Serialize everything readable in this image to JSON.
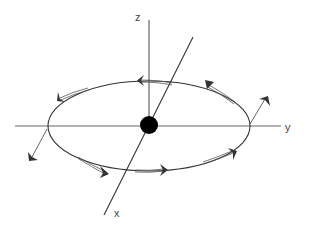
{
  "diagram": {
    "title": "",
    "colors": {
      "line": "#333333",
      "axis": "#666666",
      "arrow": "#333333",
      "dot": "#000000",
      "background": "#ffffff"
    },
    "axes": {
      "z": {
        "label": "z"
      },
      "y": {
        "label": "y"
      },
      "x": {
        "label": "x"
      }
    },
    "central_body": {
      "shape": "filled-circle"
    },
    "orbit": {
      "shape": "ellipse",
      "direction": "counterclockwise-viewed-from-top"
    },
    "tangent_arrows": [
      {
        "position": "top-center",
        "direction": "left"
      },
      {
        "position": "top-left",
        "direction": "down-left"
      },
      {
        "position": "top-right",
        "direction": "up-left"
      },
      {
        "position": "bottom-left",
        "direction": "right"
      },
      {
        "position": "bottom-center",
        "direction": "right"
      },
      {
        "position": "bottom-right",
        "direction": "up-right"
      }
    ],
    "radial_arrows": [
      {
        "position": "left-edge",
        "direction": "outward-down-left"
      },
      {
        "position": "right-edge",
        "direction": "outward-up-right"
      }
    ]
  }
}
